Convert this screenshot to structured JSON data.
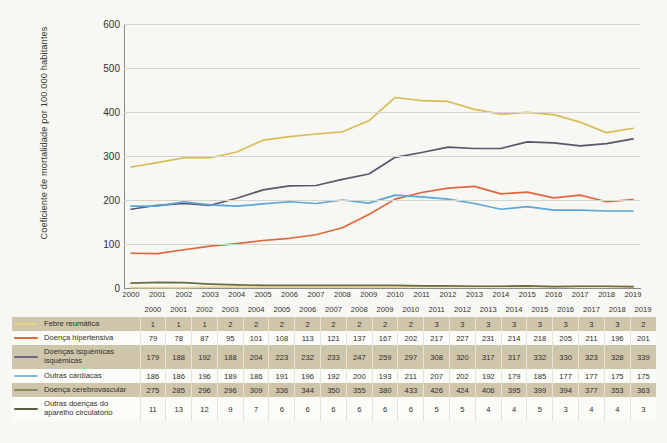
{
  "chart_data": {
    "type": "line",
    "title": "",
    "xlabel": "",
    "ylabel": "Coeficiente de mortalidade por 100.000 habitantes",
    "ylim": [
      0,
      600
    ],
    "yticks": [
      0,
      100,
      200,
      300,
      400,
      500,
      600
    ],
    "grid": true,
    "legend_position": "table-below",
    "categories": [
      "2000",
      "2001",
      "2002",
      "2003",
      "2004",
      "2005",
      "2006",
      "2007",
      "2008",
      "2009",
      "2010",
      "2011",
      "2012",
      "2013",
      "2014",
      "2015",
      "2016",
      "2017",
      "2018",
      "2019"
    ],
    "series": [
      {
        "name": "Febre reumática",
        "color": "#e7d48a",
        "values": [
          1,
          1,
          1,
          2,
          2,
          2,
          2,
          2,
          2,
          2,
          2,
          3,
          3,
          3,
          3,
          3,
          3,
          3,
          3,
          2
        ]
      },
      {
        "name": "Doença hipertensiva",
        "color": "#e1663b",
        "values": [
          79,
          78,
          87,
          95,
          101,
          108,
          113,
          121,
          137,
          167,
          202,
          217,
          227,
          231,
          214,
          218,
          205,
          211,
          196,
          201
        ]
      },
      {
        "name": "Doenças isquémicas isquémicas",
        "color": "#5b5570",
        "values": [
          179,
          188,
          192,
          188,
          204,
          223,
          232,
          233,
          247,
          259,
          297,
          308,
          320,
          317,
          317,
          332,
          330,
          323,
          328,
          339
        ]
      },
      {
        "name": "Outras cardíacas",
        "color": "#5ba7d6",
        "values": [
          186,
          186,
          196,
          189,
          186,
          191,
          196,
          192,
          200,
          193,
          211,
          207,
          202,
          192,
          179,
          185,
          177,
          177,
          175,
          175
        ]
      },
      {
        "name": "Doença cerebrovascular",
        "color": "#d6bd55",
        "values": [
          275,
          285,
          296,
          296,
          309,
          336,
          344,
          350,
          355,
          380,
          433,
          426,
          424,
          406,
          395,
          399,
          394,
          377,
          353,
          363
        ]
      },
      {
        "name": "Outras doenças do aparelho circulatório",
        "color": "#6b6b43",
        "values": [
          11,
          13,
          12,
          9,
          7,
          6,
          6,
          6,
          6,
          6,
          6,
          5,
          5,
          4,
          4,
          5,
          3,
          4,
          4,
          3
        ]
      }
    ],
    "legend_swatch_colors": {
      "febre_reumatica": "#e7d48a",
      "doenca_hipertensiva": "#e1663b",
      "doencas_isquemicas": "#6f6880",
      "outras_cardiacas": "#7fbde0",
      "doenca_cerebrovascular": "#7f9160",
      "outras_doencas": "#5e5e3c"
    }
  },
  "table": {
    "legend_header": "",
    "year_headers": [
      "2000",
      "2001",
      "2002",
      "2003",
      "2004",
      "2005",
      "2006",
      "2007",
      "2008",
      "2009",
      "2010",
      "2011",
      "2012",
      "2013",
      "2014",
      "2015",
      "2016",
      "2017",
      "2018",
      "2019"
    ],
    "rows": [
      {
        "label": "Febre reumática",
        "label_line2": "",
        "values": [
          "1",
          "1",
          "1",
          "2",
          "2",
          "2",
          "2",
          "2",
          "2",
          "2",
          "2",
          "3",
          "3",
          "3",
          "3",
          "3",
          "3",
          "3",
          "3",
          "2"
        ]
      },
      {
        "label": "Doença hipertensiva",
        "label_line2": "",
        "values": [
          "79",
          "78",
          "87",
          "95",
          "101",
          "108",
          "113",
          "121",
          "137",
          "167",
          "202",
          "217",
          "227",
          "231",
          "214",
          "218",
          "205",
          "211",
          "196",
          "201"
        ]
      },
      {
        "label": "Doenças isquémicas",
        "label_line2": "isquémicas",
        "values": [
          "179",
          "188",
          "192",
          "188",
          "204",
          "223",
          "232",
          "233",
          "247",
          "259",
          "297",
          "308",
          "320",
          "317",
          "317",
          "332",
          "330",
          "323",
          "328",
          "339"
        ]
      },
      {
        "label": "Outras cardíacas",
        "label_line2": "",
        "values": [
          "186",
          "186",
          "196",
          "189",
          "186",
          "191",
          "196",
          "192",
          "200",
          "193",
          "211",
          "207",
          "202",
          "192",
          "179",
          "185",
          "177",
          "177",
          "175",
          "175"
        ]
      },
      {
        "label": "Doença cerebrovascular",
        "label_line2": "",
        "values": [
          "275",
          "285",
          "296",
          "296",
          "309",
          "336",
          "344",
          "350",
          "355",
          "380",
          "433",
          "426",
          "424",
          "406",
          "395",
          "399",
          "394",
          "377",
          "353",
          "363"
        ]
      },
      {
        "label": "Outras doenças do",
        "label_line2": "aparelho circulatório",
        "values": [
          "11",
          "13",
          "12",
          "9",
          "7",
          "6",
          "6",
          "6",
          "6",
          "6",
          "6",
          "5",
          "5",
          "4",
          "4",
          "5",
          "3",
          "4",
          "4",
          "3"
        ]
      }
    ]
  }
}
